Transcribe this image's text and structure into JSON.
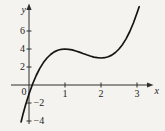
{
  "figure": {
    "background": "#f4f3ef",
    "axis_color": "#2e2e2e",
    "curve_color": "#141414",
    "text_color": "#1c1c1c"
  },
  "chart_data": {
    "type": "line",
    "title": "",
    "xlabel": "x",
    "ylabel": "y",
    "origin_label": "0",
    "xlim": [
      -0.5,
      3.45
    ],
    "ylim": [
      -5.3,
      8.9
    ],
    "x_ticks": [
      1,
      2,
      3
    ],
    "y_ticks": [
      6,
      4,
      2,
      -2,
      -4
    ],
    "grid": false,
    "legend": false,
    "series": [
      {
        "name": "cubic-curve",
        "points": [
          [
            -0.22,
            -4.1
          ],
          [
            -0.16,
            -3.16
          ],
          [
            -0.1,
            -2.29
          ],
          [
            0.0,
            -1.0
          ],
          [
            0.1,
            0.11
          ],
          [
            0.2,
            1.06
          ],
          [
            0.3,
            1.84
          ],
          [
            0.4,
            2.49
          ],
          [
            0.5,
            3.0
          ],
          [
            0.6,
            3.39
          ],
          [
            0.7,
            3.68
          ],
          [
            0.8,
            3.86
          ],
          [
            0.9,
            3.97
          ],
          [
            1.0,
            4.0
          ],
          [
            1.1,
            3.97
          ],
          [
            1.2,
            3.9
          ],
          [
            1.3,
            3.78
          ],
          [
            1.4,
            3.65
          ],
          [
            1.5,
            3.5
          ],
          [
            1.6,
            3.35
          ],
          [
            1.7,
            3.22
          ],
          [
            1.8,
            3.1
          ],
          [
            1.9,
            3.03
          ],
          [
            2.0,
            3.0
          ],
          [
            2.1,
            3.03
          ],
          [
            2.2,
            3.14
          ],
          [
            2.3,
            3.32
          ],
          [
            2.4,
            3.61
          ],
          [
            2.5,
            4.0
          ],
          [
            2.6,
            4.51
          ],
          [
            2.7,
            5.16
          ],
          [
            2.8,
            5.94
          ],
          [
            2.9,
            6.89
          ],
          [
            3.0,
            8.0
          ],
          [
            3.06,
            8.7
          ]
        ],
        "features": {
          "local_max": [
            1,
            4
          ],
          "local_min": [
            2,
            3
          ],
          "y_intercept": [
            0,
            -1
          ]
        }
      }
    ]
  }
}
